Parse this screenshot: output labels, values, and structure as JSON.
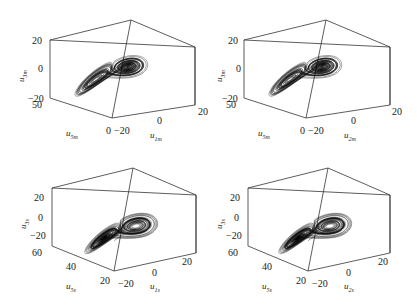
{
  "chart_data": [
    {
      "type": "line3d",
      "title": "",
      "panel": "top-left",
      "zlabel": {
        "base": "u",
        "sub": "3m"
      },
      "xlabel": {
        "base": "u",
        "sub": "5m"
      },
      "ylabel": {
        "base": "u",
        "sub": "1m"
      },
      "zticks": [
        "20",
        "0",
        "−20"
      ],
      "xticks": [
        "50",
        "0"
      ],
      "yticks": [
        "−20",
        "0",
        "20"
      ],
      "zlim": [
        -20,
        20
      ],
      "xlim": [
        0,
        50
      ],
      "ylim": [
        -20,
        20
      ],
      "description": "Lorenz-like double-scroll chaotic attractor (drive system)"
    },
    {
      "type": "line3d",
      "title": "",
      "panel": "top-right",
      "zlabel": {
        "base": "u",
        "sub": "3m"
      },
      "xlabel": {
        "base": "u",
        "sub": "5m"
      },
      "ylabel": {
        "base": "u",
        "sub": "2m"
      },
      "zticks": [
        "20",
        "0",
        "−20"
      ],
      "xticks": [
        "50",
        "0"
      ],
      "yticks": [
        "−20",
        "0",
        "20"
      ],
      "zlim": [
        -20,
        20
      ],
      "xlim": [
        0,
        50
      ],
      "ylim": [
        -20,
        20
      ],
      "description": "Lorenz-like double-scroll chaotic attractor (drive system)"
    },
    {
      "type": "line3d",
      "title": "",
      "panel": "bottom-left",
      "zlabel": {
        "base": "u",
        "sub": "3s"
      },
      "xlabel": {
        "base": "u",
        "sub": "5s"
      },
      "ylabel": {
        "base": "u",
        "sub": "1s"
      },
      "zticks": [
        "20",
        "0",
        "−20"
      ],
      "xticks": [
        "60",
        "40",
        "20"
      ],
      "yticks": [
        "−20",
        "0",
        "20"
      ],
      "zlim": [
        -30,
        30
      ],
      "xlim": [
        20,
        60
      ],
      "ylim": [
        -20,
        20
      ],
      "description": "Response system chaotic attractor with initial transient"
    },
    {
      "type": "line3d",
      "title": "",
      "panel": "bottom-right",
      "zlabel": {
        "base": "u",
        "sub": "3s"
      },
      "xlabel": {
        "base": "u",
        "sub": "5s"
      },
      "ylabel": {
        "base": "u",
        "sub": "2s"
      },
      "zticks": [
        "20",
        "0",
        "−20"
      ],
      "xticks": [
        "60",
        "40",
        "20"
      ],
      "yticks": [
        "−20",
        "0",
        "20"
      ],
      "zlim": [
        -30,
        30
      ],
      "xlim": [
        20,
        60
      ],
      "ylim": [
        -20,
        20
      ],
      "description": "Response system chaotic attractor with initial transient"
    }
  ]
}
